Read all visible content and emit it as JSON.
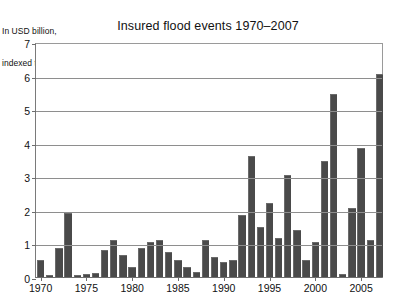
{
  "chart_data": {
    "type": "bar",
    "title": "Insured flood events 1970–2007",
    "subtitle_lines": [
      "In USD billion,",
      "indexed to 2007"
    ],
    "xlabel": "",
    "ylabel": "",
    "ylim": [
      0,
      7
    ],
    "ytick_values": [
      0,
      1,
      2,
      3,
      4,
      5,
      6,
      7
    ],
    "ytick_labels": [
      "0",
      "1",
      "2",
      "3",
      "4",
      "5",
      "6",
      "7"
    ],
    "grid": "horizontal",
    "legend": "none",
    "bar_color": "#4a4a4a",
    "xtick_labels": [
      "1970",
      "1975",
      "1980",
      "1985",
      "1990",
      "1995",
      "2000",
      "2005"
    ],
    "xtick_years": [
      1970,
      1975,
      1980,
      1985,
      1990,
      1995,
      2000,
      2005
    ],
    "categories": [
      "1970",
      "1971",
      "1972",
      "1973",
      "1974",
      "1975",
      "1976",
      "1977",
      "1978",
      "1979",
      "1980",
      "1981",
      "1982",
      "1983",
      "1984",
      "1985",
      "1986",
      "1987",
      "1988",
      "1989",
      "1990",
      "1991",
      "1992",
      "1993",
      "1994",
      "1995",
      "1996",
      "1997",
      "1998",
      "1999",
      "2000",
      "2001",
      "2002",
      "2003",
      "2004",
      "2005",
      "2006",
      "2007"
    ],
    "values": [
      0.5,
      0.05,
      0.85,
      1.9,
      0.05,
      0.1,
      0.12,
      0.8,
      1.1,
      0.65,
      0.3,
      0.85,
      1.05,
      1.1,
      0.75,
      0.5,
      0.3,
      0.15,
      1.1,
      0.6,
      0.45,
      0.5,
      1.85,
      3.6,
      1.5,
      2.2,
      1.15,
      3.05,
      1.4,
      0.5,
      1.05,
      3.45,
      5.45,
      0.1,
      2.05,
      3.85,
      1.1,
      6.05
    ]
  }
}
